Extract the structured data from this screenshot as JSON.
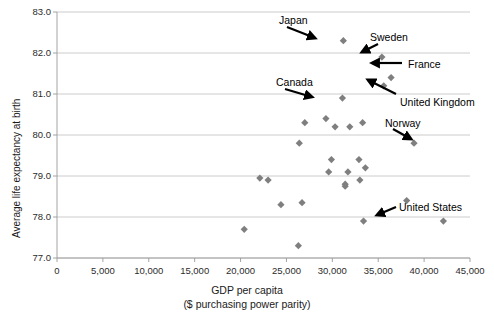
{
  "chart_data": {
    "type": "scatter",
    "title": "",
    "xlabel": "GDP per capita",
    "xlabel_line2": "($ purchasing power parity)",
    "ylabel": "Average life expectancy at birth",
    "xlim": [
      0,
      45000
    ],
    "ylim": [
      77.0,
      83.0
    ],
    "xticks": [
      0,
      5000,
      10000,
      15000,
      20000,
      25000,
      30000,
      35000,
      40000,
      45000
    ],
    "xtick_labels": [
      "0",
      "5,000",
      "10,000",
      "15,000",
      "20,000",
      "25,000",
      "30,000",
      "35,000",
      "40,000",
      "45,000"
    ],
    "yticks": [
      77.0,
      78.0,
      79.0,
      80.0,
      81.0,
      82.0,
      83.0
    ],
    "ytick_labels": [
      "77.0",
      "78.0",
      "79.0",
      "80.0",
      "81.0",
      "82.0",
      "83.0"
    ],
    "grid": true,
    "grid_axis": "y",
    "legend": false,
    "marker": "diamond",
    "marker_color": "#7f7f7f",
    "points": [
      {
        "x": 31200,
        "y": 82.3,
        "label": "Japan"
      },
      {
        "x": 35400,
        "y": 81.9,
        "label": "Sweden"
      },
      {
        "x": 36400,
        "y": 81.4,
        "label": "France"
      },
      {
        "x": 35600,
        "y": 81.2,
        "label": "United Kingdom"
      },
      {
        "x": 31100,
        "y": 80.9,
        "label": "Canada"
      },
      {
        "x": 38900,
        "y": 79.8,
        "label": "Norway"
      },
      {
        "x": 42100,
        "y": 77.9,
        "label": "United States"
      },
      {
        "x": 27000,
        "y": 80.3,
        "label": ""
      },
      {
        "x": 29300,
        "y": 80.4,
        "label": ""
      },
      {
        "x": 30300,
        "y": 80.2,
        "label": ""
      },
      {
        "x": 31900,
        "y": 80.2,
        "label": ""
      },
      {
        "x": 33300,
        "y": 80.3,
        "label": ""
      },
      {
        "x": 26400,
        "y": 79.8,
        "label": ""
      },
      {
        "x": 29900,
        "y": 79.4,
        "label": ""
      },
      {
        "x": 32900,
        "y": 79.4,
        "label": ""
      },
      {
        "x": 29600,
        "y": 79.1,
        "label": ""
      },
      {
        "x": 31700,
        "y": 79.1,
        "label": ""
      },
      {
        "x": 33600,
        "y": 79.2,
        "label": ""
      },
      {
        "x": 22100,
        "y": 78.95,
        "label": ""
      },
      {
        "x": 23000,
        "y": 78.9,
        "label": ""
      },
      {
        "x": 31400,
        "y": 78.8,
        "label": ""
      },
      {
        "x": 31400,
        "y": 78.75,
        "label": ""
      },
      {
        "x": 33000,
        "y": 78.9,
        "label": ""
      },
      {
        "x": 26700,
        "y": 78.35,
        "label": ""
      },
      {
        "x": 24400,
        "y": 78.3,
        "label": ""
      },
      {
        "x": 38100,
        "y": 78.4,
        "label": ""
      },
      {
        "x": 20400,
        "y": 77.7,
        "label": ""
      },
      {
        "x": 33400,
        "y": 77.9,
        "label": ""
      },
      {
        "x": 26300,
        "y": 77.3,
        "label": ""
      }
    ],
    "annotations": [
      {
        "text": "Japan",
        "tx": 279,
        "ty": 15,
        "ax1": 287,
        "ay1": 27,
        "ax2": 315,
        "ay2": 38
      },
      {
        "text": "Sweden",
        "tx": 370,
        "ty": 32,
        "ax1": 378,
        "ay1": 44,
        "ax2": 362,
        "ay2": 52
      },
      {
        "text": "France",
        "tx": 408,
        "ty": 59,
        "ax1": 402,
        "ay1": 63,
        "ax2": 372,
        "ay2": 63
      },
      {
        "text": "Canada",
        "tx": 276,
        "ty": 77,
        "ax1": 285,
        "ay1": 89,
        "ax2": 312,
        "ay2": 97
      },
      {
        "text": "United Kingdom",
        "tx": 400,
        "ty": 97,
        "ax1": 396,
        "ay1": 94,
        "ax2": 368,
        "ay2": 80
      },
      {
        "text": "Norway",
        "tx": 385,
        "ty": 118,
        "ax1": 393,
        "ay1": 129,
        "ax2": 411,
        "ay2": 139
      },
      {
        "text": "United States",
        "tx": 399,
        "ty": 202,
        "ax1": 396,
        "ay1": 207,
        "ax2": 377,
        "ay2": 215
      }
    ]
  }
}
